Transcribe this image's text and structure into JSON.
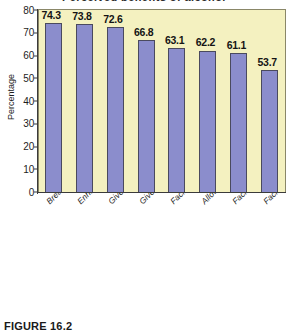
{
  "figure": {
    "caption": "FIGURE 16.2",
    "top_clipped_title": "Perceived benefits of alcohol"
  },
  "chart_data": {
    "type": "bar",
    "title": "",
    "xlabel": "",
    "ylabel": "Percentage",
    "ylim": [
      0,
      80
    ],
    "ytick_step": 10,
    "yticks": [
      "0",
      "10",
      "20",
      "30",
      "40",
      "50",
      "60",
      "70",
      "80"
    ],
    "grid": false,
    "legend": "none",
    "categories": [
      "Breaks the ice",
      "Enhances social activity",
      "Gives people something to do",
      "Gives people something talk about",
      "Facilitates male bonding",
      "Allows people to have more fun",
      "Facilitates contact with peers",
      "Facilities sexual opportunities"
    ],
    "values": [
      74.3,
      73.8,
      72.6,
      66.8,
      63.1,
      62.2,
      61.1,
      53.7
    ],
    "value_labels": [
      "74.3",
      "73.8",
      "72.6",
      "66.8",
      "63.1",
      "62.2",
      "61.1",
      "53.7"
    ],
    "colors": {
      "bar_fill": "#8b8dcc",
      "bar_edge": "#4a4a5e",
      "plot_background": "#f4f1c0",
      "plot_border": "#8a8768",
      "axis": "#3b3b3b",
      "text": "#1d1d1d",
      "page_background": "#ffffff"
    }
  }
}
